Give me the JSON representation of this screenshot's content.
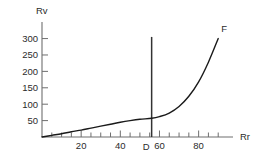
{
  "chart_data": {
    "type": "line",
    "title": "",
    "xlabel": "Rr",
    "ylabel": "Rv",
    "xlim": [
      0,
      95
    ],
    "ylim": [
      0,
      320
    ],
    "grid": false,
    "legend": null,
    "x_ticks": [
      20,
      40,
      60,
      80
    ],
    "x_tick_labels": [
      "20",
      "40",
      "60",
      "80"
    ],
    "x_minor_tick_step": 5,
    "y_ticks": [
      50,
      100,
      150,
      200,
      250,
      300
    ],
    "y_tick_labels": [
      "50",
      "100",
      "150",
      "200",
      "250",
      "300"
    ],
    "series": [
      {
        "name": "F",
        "end_label": "F",
        "color": "#1a1a1a",
        "x": [
          0,
          5,
          10,
          15,
          20,
          25,
          30,
          35,
          40,
          45,
          50,
          56,
          60,
          65,
          70,
          75,
          80,
          85,
          90
        ],
        "y": [
          0,
          5,
          10,
          16,
          21,
          27,
          33,
          39,
          45,
          50,
          54,
          57,
          62,
          73,
          93,
          124,
          168,
          228,
          300
        ]
      }
    ],
    "annotations": [
      {
        "name": "D",
        "label": "D",
        "type": "vertical-line",
        "x": 56,
        "y_from": 0,
        "y_to": 305,
        "color": "#333333"
      }
    ]
  },
  "axis": {
    "x_title": "Rr",
    "y_title": "Rv"
  },
  "colors": {
    "axis": "#6e6e6e",
    "curve": "#1a1a1a",
    "marker_line": "#333333",
    "text": "#2b2b2b",
    "background": "#ffffff"
  }
}
